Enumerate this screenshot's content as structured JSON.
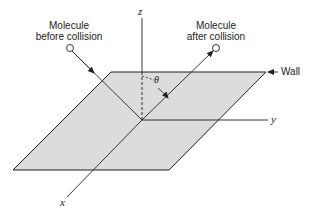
{
  "diagram": {
    "type": "molecule-wall-collision",
    "labels": {
      "before_line1": "Molecule",
      "before_line2": "before collision",
      "after_line1": "Molecule",
      "after_line2": "after collision",
      "wall": "Wall",
      "axis_z": "z",
      "axis_y": "y",
      "axis_x": "x",
      "angle": "θ"
    },
    "colors": {
      "plane_fill": "#dcdcdc",
      "line": "#222222",
      "background": "#ffffff"
    }
  }
}
